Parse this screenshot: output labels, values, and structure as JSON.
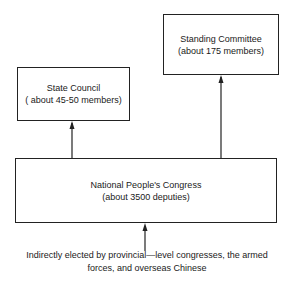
{
  "diagram": {
    "nodes": {
      "standing_committee": {
        "title": "Standing Committee",
        "subtitle": "(about 175 members)"
      },
      "state_council": {
        "title": "State Council",
        "subtitle": "( about 45-50 members)"
      },
      "npc": {
        "title": "National People's Congress",
        "subtitle": "(about 3500 deputies)"
      }
    },
    "edges": [
      {
        "from": "npc",
        "to": "state_council"
      },
      {
        "from": "npc",
        "to": "standing_committee"
      },
      {
        "from": "electorate",
        "to": "npc"
      }
    ],
    "footnote": {
      "line1": "Indirectly elected by provincial—level congresses, the armed",
      "line2": "forces, and overseas Chinese"
    }
  },
  "colors": {
    "line": "#222222",
    "background": "#ffffff"
  }
}
